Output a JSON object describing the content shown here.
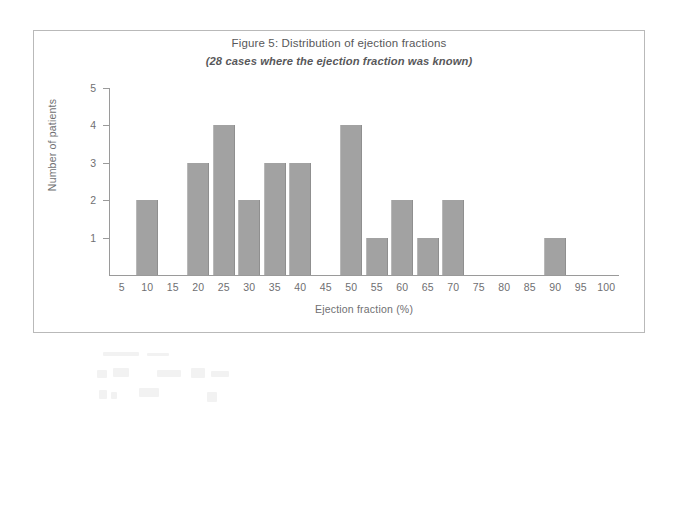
{
  "figure": {
    "title": "Figure 5: Distribution of ejection fractions",
    "subtitle": "(28 cases where the ejection fraction was known)"
  },
  "chart_data": {
    "type": "bar",
    "title": "Figure 5: Distribution of ejection fractions",
    "subtitle": "(28 cases where the ejection fraction was known)",
    "xlabel": "Ejection fraction (%)",
    "ylabel": "Number of patients",
    "categories": [
      5,
      10,
      15,
      20,
      25,
      30,
      35,
      40,
      45,
      50,
      55,
      60,
      65,
      70,
      75,
      80,
      85,
      90,
      95,
      100
    ],
    "values": [
      0,
      2,
      0,
      3,
      4,
      2,
      3,
      3,
      0,
      4,
      1,
      2,
      1,
      2,
      0,
      0,
      0,
      1,
      0,
      0
    ],
    "xlim": [
      2.5,
      102.5
    ],
    "ylim": [
      0,
      5
    ],
    "xticks": [
      5,
      10,
      15,
      20,
      25,
      30,
      35,
      40,
      45,
      50,
      55,
      60,
      65,
      70,
      75,
      80,
      85,
      90,
      95,
      100
    ],
    "yticks": [
      1,
      2,
      3,
      4,
      5
    ],
    "grid": false,
    "legend": false,
    "total_cases": 28,
    "bar_color": "#a2a2a2",
    "axis_color": "#9a9a9a",
    "text_color": "#6f6f72"
  }
}
